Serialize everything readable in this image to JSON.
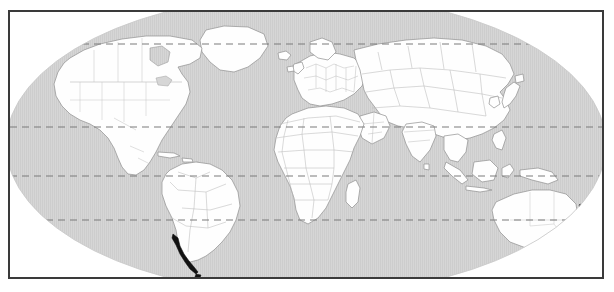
{
  "figure": {
    "kind": "world-map",
    "projection": "elliptical",
    "title": "",
    "caption": "",
    "frame": {
      "border_color": "#3a3a3a",
      "border_width_px": 2,
      "background_color": "#ffffff"
    },
    "colors": {
      "ocean": "#d4d4d4",
      "ocean_stripe": "#cbcbcb",
      "land_fill": "#fefefe",
      "coastline": "#8c8c8c",
      "country_border": "#b4b4b4",
      "graticule": "#7a7a7a",
      "highlight": "#111111",
      "outside_globe": "#ffffff"
    },
    "graticule": {
      "style": "dashed",
      "dash_pattern": "7 5",
      "lines": [
        {
          "name": "arctic-circle",
          "label": "Arctic Circle",
          "latitude": 66.5,
          "y_px": 42
        },
        {
          "name": "tropic-of-cancer",
          "label": "Tropic of Cancer",
          "latitude": 23.5,
          "y_px": 125
        },
        {
          "name": "equator",
          "label": "Equator",
          "latitude": 0,
          "y_px": 174
        },
        {
          "name": "tropic-of-capricorn",
          "label": "Tropic of Capricorn",
          "latitude": -23.5,
          "y_px": 218
        }
      ]
    },
    "highlighted_regions": [
      {
        "name": "southern-chile",
        "label": "Southern Chile / Patagonia",
        "color": "#111111"
      },
      {
        "name": "new-zealand",
        "label": "New Zealand",
        "color": "#111111"
      },
      {
        "name": "new-caledonia",
        "label": "New Caledonia",
        "color": "#111111"
      }
    ],
    "landmasses": [
      {
        "name": "north-america",
        "label": "North America"
      },
      {
        "name": "south-america",
        "label": "South America"
      },
      {
        "name": "europe",
        "label": "Europe"
      },
      {
        "name": "africa",
        "label": "Africa"
      },
      {
        "name": "asia",
        "label": "Asia"
      },
      {
        "name": "australia",
        "label": "Australia"
      },
      {
        "name": "greenland",
        "label": "Greenland"
      },
      {
        "name": "madagascar",
        "label": "Madagascar"
      },
      {
        "name": "japan",
        "label": "Japan"
      },
      {
        "name": "indonesia",
        "label": "Indonesia"
      },
      {
        "name": "new-guinea",
        "label": "New Guinea"
      },
      {
        "name": "british-isles",
        "label": "British Isles"
      },
      {
        "name": "iceland",
        "label": "Iceland"
      },
      {
        "name": "sri-lanka",
        "label": "Sri Lanka"
      },
      {
        "name": "philippines",
        "label": "Philippines"
      },
      {
        "name": "cuba",
        "label": "Cuba"
      },
      {
        "name": "tasmania",
        "label": "Tasmania"
      }
    ]
  }
}
